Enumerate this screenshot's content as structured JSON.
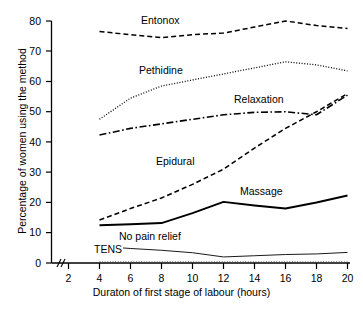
{
  "chart_data": {
    "type": "line",
    "title": "",
    "xlabel": "Duraton of first stage of labour (hours)",
    "ylabel": "Percentage of women using the method",
    "xlim": [
      2,
      20
    ],
    "ylim": [
      0,
      80
    ],
    "xticks": [
      2,
      4,
      6,
      8,
      10,
      12,
      14,
      16,
      18,
      20
    ],
    "yticks": [
      0,
      10,
      20,
      30,
      40,
      50,
      60,
      70,
      80
    ],
    "xtick_labels": [
      "2",
      "4",
      "6",
      "8",
      "10",
      "12",
      "14",
      "16",
      "18",
      "20"
    ],
    "ytick_labels": [
      "0",
      "10",
      "20",
      "30",
      "40",
      "50",
      "60",
      "70",
      "80"
    ],
    "grid": false,
    "legend": "inline-annotations",
    "axis_break": "//",
    "x": [
      4,
      6,
      8,
      10,
      12,
      14,
      16,
      18,
      20
    ],
    "series": [
      {
        "name": "Entonox",
        "style": "dashed",
        "values": [
          76.5,
          75.5,
          74.5,
          75.5,
          76.0,
          78.0,
          80.0,
          78.5,
          77.5
        ],
        "label_x": 140,
        "label_y": 20
      },
      {
        "name": "Pethidine",
        "style": "dotted",
        "values": [
          47.5,
          54.5,
          58.5,
          60.5,
          62.5,
          64.5,
          66.5,
          65.5,
          63.5
        ],
        "label_x": 138,
        "label_y": 70
      },
      {
        "name": "Relaxation",
        "style": "dash-dot",
        "values": [
          42.3,
          44.5,
          46.0,
          47.5,
          49.0,
          49.8,
          50.0,
          49.0,
          55.5
        ],
        "label_x": 232,
        "label_y": 99
      },
      {
        "name": "Epidural",
        "style": "dashed",
        "values": [
          14.2,
          18.0,
          21.5,
          26.0,
          31.0,
          38.0,
          44.5,
          50.0,
          56.0
        ],
        "label_x": 155,
        "label_y": 161
      },
      {
        "name": "Massage",
        "style": "solid",
        "values": [
          12.5,
          12.8,
          13.2,
          16.5,
          20.2,
          19.0,
          18.0,
          20.0,
          22.3
        ],
        "label_x": 238,
        "label_y": 191
      },
      {
        "name": "No pain relief",
        "style": "thin-solid",
        "values": [
          5.5,
          4.8,
          4.2,
          3.4,
          2.0,
          2.4,
          2.8,
          3.0,
          3.5
        ],
        "label_x": 117,
        "label_y": 236
      },
      {
        "name": "TENS",
        "style": "thin-dotted",
        "values": [
          0.4,
          0.4,
          0.4,
          0.4,
          0.4,
          0.4,
          0.4,
          0.4,
          0.4
        ],
        "label_x": 93,
        "label_y": 249
      }
    ]
  },
  "axes": {
    "x_title": "Duraton of first stage of labour (hours)",
    "y_title": "Percentage of women using the method",
    "y_labels": [
      "80",
      "70",
      "60",
      "50",
      "40",
      "30",
      "20",
      "10",
      "0"
    ],
    "x_labels": [
      "2",
      "4",
      "6",
      "8",
      "10",
      "12",
      "14",
      "16",
      "18",
      "20"
    ]
  },
  "labels": {
    "entonox": "Entonox",
    "pethidine": "Pethidine",
    "relaxation": "Relaxation",
    "epidural": "Epidural",
    "massage": "Massage",
    "no_pain_relief": "No pain relief",
    "tens": "TENS"
  },
  "colors": {
    "ink": "#000000",
    "background": "#ffffff",
    "light_ink": "#555555"
  }
}
